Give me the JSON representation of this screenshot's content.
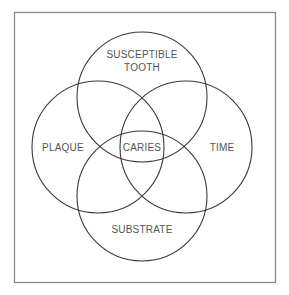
{
  "diagram": {
    "type": "venn",
    "circles": [
      {
        "id": "susceptible-tooth",
        "label_lines": [
          "SUSCEPTIBLE",
          "TOOTH"
        ],
        "cx": 142,
        "cy": 97,
        "r": 65
      },
      {
        "id": "plaque",
        "label_lines": [
          "PLAQUE"
        ],
        "cx": 98,
        "cy": 147,
        "r": 66
      },
      {
        "id": "time",
        "label_lines": [
          "TIME"
        ],
        "cx": 186,
        "cy": 147,
        "r": 66
      },
      {
        "id": "substrate",
        "label_lines": [
          "SUBSTRATE"
        ],
        "cx": 142,
        "cy": 196,
        "r": 65
      }
    ],
    "center_label": "CARIES",
    "labels": {
      "top_line1": "SUSCEPTIBLE",
      "top_line2": "TOOTH",
      "left": "PLAQUE",
      "right": "TIME",
      "bottom": "SUBSTRATE",
      "center": "CARIES"
    },
    "colors": {
      "stroke": "#3a3a3a",
      "text": "#555555",
      "frame": "#8a8a8a",
      "background": "#ffffff"
    }
  }
}
